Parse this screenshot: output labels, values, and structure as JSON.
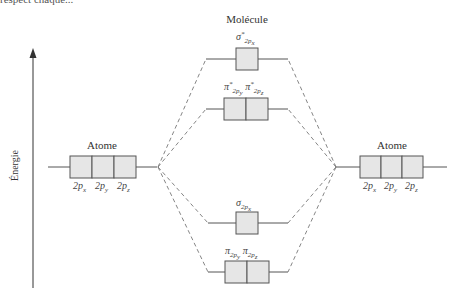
{
  "header": {
    "cropped_text": "respect chaque..."
  },
  "diagram": {
    "molecule_title": "Molécule",
    "axis_label": "Énergie",
    "left_atom": {
      "title": "Atome",
      "orbitals": [
        "2px",
        "2py",
        "2pz"
      ]
    },
    "right_atom": {
      "title": "Atome",
      "orbitals": [
        "2px",
        "2py",
        "2pz"
      ]
    },
    "molecular_orbitals": [
      {
        "name": "sigma*2px",
        "symbol": "σ",
        "star": "*",
        "sub": "2px",
        "boxes": 1
      },
      {
        "name": "pi*2py pi*2pz",
        "symbols": [
          "π",
          "π"
        ],
        "star": "*",
        "subs": [
          "2py",
          "2pz"
        ],
        "boxes": 2
      },
      {
        "name": "sigma2px",
        "symbol": "σ",
        "sub": "2px",
        "boxes": 1
      },
      {
        "name": "pi2py pi2pz",
        "symbols": [
          "π",
          "π"
        ],
        "subs": [
          "2py",
          "2pz"
        ],
        "boxes": 2
      }
    ],
    "colors": {
      "box_fill": "#e6e6e6",
      "line": "#555555",
      "dashed": "#777777"
    }
  }
}
